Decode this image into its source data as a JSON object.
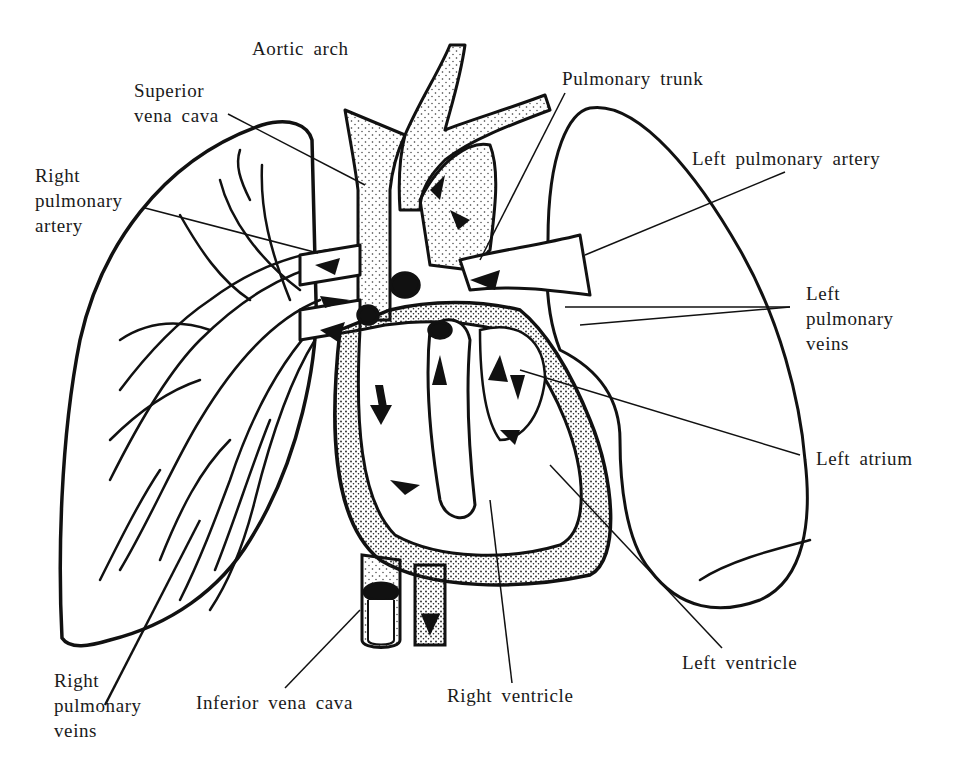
{
  "diagram": {
    "colors": {
      "ink": "#111111",
      "background": "#ffffff",
      "stipple": "#333333"
    },
    "labels": {
      "aortic_arch": {
        "lines": [
          "Aortic arch"
        ]
      },
      "superior_vena_cava": {
        "lines": [
          "Superior",
          "vena cava"
        ]
      },
      "right_pulmonary_artery": {
        "lines": [
          "Right",
          "pulmonary",
          "artery"
        ]
      },
      "pulmonary_trunk": {
        "lines": [
          "Pulmonary trunk"
        ]
      },
      "left_pulmonary_artery": {
        "lines": [
          "Left pulmonary artery"
        ]
      },
      "left_pulmonary_veins": {
        "lines": [
          "Left",
          "pulmonary",
          "veins"
        ]
      },
      "left_atrium": {
        "lines": [
          "Left atrium"
        ]
      },
      "left_ventricle": {
        "lines": [
          "Left ventricle"
        ]
      },
      "right_ventricle": {
        "lines": [
          "Right ventricle"
        ]
      },
      "inferior_vena_cava": {
        "lines": [
          "Inferior vena cava"
        ]
      },
      "right_pulmonary_veins": {
        "lines": [
          "Right",
          "pulmonary",
          "veins"
        ]
      }
    }
  }
}
